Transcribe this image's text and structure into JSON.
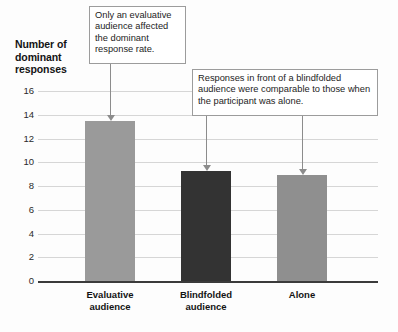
{
  "chart_data": {
    "type": "bar",
    "title": "",
    "xlabel": "",
    "ylabel": "Number of dominant responses",
    "categories": [
      "Evaluative audience",
      "Blindfolded audience",
      "Alone"
    ],
    "values": [
      13.5,
      9.3,
      8.9
    ],
    "ylim": [
      0,
      16
    ],
    "yticks": [
      0,
      2,
      4,
      6,
      8,
      10,
      12,
      14,
      16
    ],
    "ytick_labels": [
      "0",
      "2",
      "4",
      "6",
      "8",
      "10",
      "12",
      "14",
      "16"
    ],
    "grid": true,
    "legend": "none",
    "bar_colors": [
      "#9a9a9a",
      "#333333",
      "#8f8f8f"
    ],
    "annotations": [
      {
        "text": "Only an evaluative audience affected the dominant response rate.",
        "points_to": "Evaluative audience"
      },
      {
        "text": "Responses in front of a blindfolded audience were comparable to those when the participant was alone.",
        "points_to": "Blindfolded audience, Alone"
      }
    ]
  },
  "axis": {
    "y_title_line1": "Number of",
    "y_title_line2": "dominant",
    "y_title_line3": "responses"
  },
  "xlabels": [
    {
      "line1": "Evaluative",
      "line2": "audience"
    },
    {
      "line1": "Blindfolded",
      "line2": "audience"
    },
    {
      "line1": "Alone",
      "line2": ""
    }
  ],
  "colors": {
    "gridline": "#d6d6d6",
    "baseline": "#3b3b3b",
    "callout_border": "#9c9c9c",
    "leader": "#8c8c8c",
    "text": "#141414",
    "background": "#fdfdfd"
  }
}
